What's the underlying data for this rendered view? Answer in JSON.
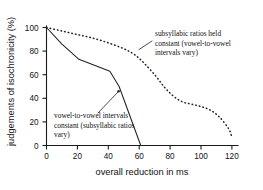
{
  "chart_data": {
    "type": "line",
    "title": "",
    "xlabel": "overall reduction in ms",
    "ylabel": "judgements of isochronicity (%)",
    "xlim": [
      0,
      125
    ],
    "ylim": [
      0,
      105
    ],
    "xticks": [
      0,
      20,
      40,
      60,
      80,
      100,
      120
    ],
    "xtick_labels": [
      "0",
      "20",
      "40",
      "60",
      "80",
      "100",
      "120"
    ],
    "yticks": [
      0,
      20,
      40,
      60,
      80,
      100
    ],
    "ytick_labels": [
      "0",
      "20",
      "40",
      "60",
      "80",
      "100"
    ],
    "grid": false,
    "legend_position": "none",
    "series": [
      {
        "name": "vowel-to-vowel intervals constant (subsyllabic ratios vary)",
        "style": "solid",
        "x": [
          0,
          10,
          21,
          31,
          41,
          47,
          61
        ],
        "values": [
          100,
          86,
          73,
          68,
          63,
          50,
          0
        ]
      },
      {
        "name": "subsyllabic ratios held constant (vowel-to-vowel intervals vary)",
        "style": "dotted",
        "x": [
          0,
          10,
          20,
          30,
          40,
          50,
          57,
          63,
          70,
          76,
          82,
          88,
          94,
          100,
          106,
          112,
          118,
          120
        ],
        "values": [
          100,
          97,
          94,
          91,
          87,
          82,
          77,
          70,
          60,
          50,
          42,
          37,
          35,
          33,
          30,
          24,
          14,
          7
        ]
      }
    ],
    "annotations": [
      {
        "id": "annotation-dotted",
        "lines": [
          "subsyllabic ratios held",
          "constant (vowel-to-vowel",
          "intervals vary)"
        ]
      },
      {
        "id": "annotation-solid",
        "lines": [
          "vowel-to-vowel intervals",
          "constant (subsyllabic ratios",
          "vary)"
        ]
      }
    ],
    "colors": {
      "axis": "#1a1a1a",
      "series_solid": "#222222",
      "series_dotted": "#222222",
      "background": "#ffffff"
    }
  }
}
